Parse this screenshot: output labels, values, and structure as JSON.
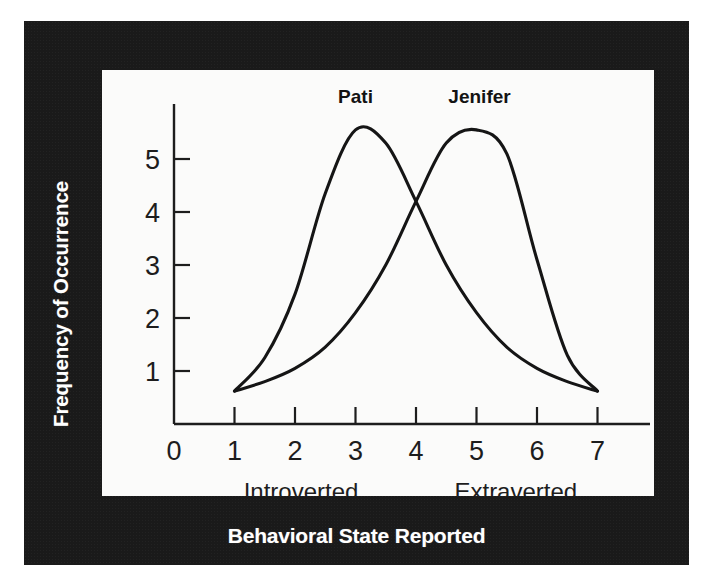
{
  "figure": {
    "y_axis_title": "Frequency of Occurrence",
    "x_axis_title": "Behavioral State Reported"
  },
  "chart_data": {
    "type": "line",
    "title": "",
    "xlabel": "Behavioral State Reported",
    "ylabel": "Frequency of Occurrence",
    "xlim": [
      0,
      7.6
    ],
    "ylim": [
      0,
      6.0
    ],
    "grid": false,
    "legend": "inline-curve-labels",
    "x_ticks": [
      "0",
      "1",
      "2",
      "3",
      "4",
      "5",
      "6",
      "7"
    ],
    "x_tick_values": [
      0,
      1,
      2,
      3,
      4,
      5,
      6,
      7
    ],
    "y_ticks": [
      "1",
      "2",
      "3",
      "4",
      "5"
    ],
    "y_tick_values": [
      1,
      2,
      3,
      4,
      5
    ],
    "x_end_labels": [
      {
        "text": "Introverted",
        "at_x": 2.1
      },
      {
        "text": "Extraverted",
        "at_x": 5.65
      }
    ],
    "annotations": [
      {
        "text": "Pati",
        "at_x": 3.0,
        "at_y": 6.05
      },
      {
        "text": "Jenifer",
        "at_x": 5.05,
        "at_y": 6.05
      }
    ],
    "series": [
      {
        "name": "Pati",
        "peak_x": 3.0,
        "peak_y": 5.55,
        "x": [
          1.0,
          1.5,
          2.0,
          2.5,
          3.0,
          3.5,
          4.0,
          4.5,
          5.0,
          5.5,
          6.0,
          6.5,
          7.0
        ],
        "values": [
          0.62,
          1.25,
          2.45,
          4.35,
          5.55,
          5.3,
          4.2,
          3.0,
          2.1,
          1.45,
          1.05,
          0.8,
          0.62
        ]
      },
      {
        "name": "Jenifer",
        "peak_x": 5.05,
        "peak_y": 5.55,
        "x": [
          1.0,
          1.5,
          2.0,
          2.5,
          3.0,
          3.5,
          4.0,
          4.5,
          5.0,
          5.5,
          6.0,
          6.5,
          7.0
        ],
        "values": [
          0.62,
          0.8,
          1.05,
          1.45,
          2.1,
          3.0,
          4.2,
          5.3,
          5.55,
          5.1,
          3.1,
          1.3,
          0.62
        ]
      }
    ]
  }
}
